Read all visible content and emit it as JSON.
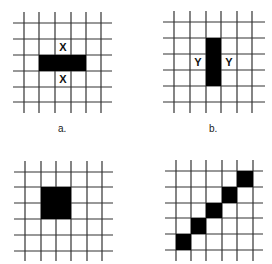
{
  "figure": {
    "colors": {
      "grid_line": "#333333",
      "fill": "#000000",
      "background": "#ffffff"
    },
    "panels": [
      {
        "id": "a",
        "caption": "a.",
        "grid": {
          "x": [
            24,
            39,
            55,
            71,
            86,
            101
          ],
          "y": [
            23,
            39,
            55,
            71,
            87,
            102
          ],
          "extent": [
            13,
            12,
            112,
            113
          ]
        },
        "filled_cells": [
          {
            "x": 39,
            "y": 55,
            "w": 47,
            "h": 16
          }
        ],
        "markers": [
          {
            "text": "X",
            "x": 55,
            "y": 39
          },
          {
            "text": "X",
            "x": 55,
            "y": 71
          }
        ]
      },
      {
        "id": "b",
        "caption": "b.",
        "grid": {
          "x": [
            174,
            190,
            206,
            221,
            237,
            252
          ],
          "y": [
            22,
            38,
            54,
            70,
            86,
            102
          ],
          "extent": [
            163,
            11,
            265,
            113
          ]
        },
        "filled_cells": [
          {
            "x": 206,
            "y": 38,
            "w": 15,
            "h": 48
          }
        ],
        "markers": [
          {
            "text": "Y",
            "x": 190,
            "y": 54
          },
          {
            "text": "Y",
            "x": 221,
            "y": 54
          }
        ]
      },
      {
        "id": "c",
        "caption": "",
        "grid": {
          "x": [
            25,
            41,
            56,
            71,
            87,
            102
          ],
          "y": [
            172,
            187,
            203,
            219,
            235,
            251
          ],
          "extent": [
            14,
            161,
            113,
            261
          ]
        },
        "filled_cells": [
          {
            "x": 41,
            "y": 187,
            "w": 30,
            "h": 32
          }
        ],
        "markers": []
      },
      {
        "id": "d",
        "caption": "",
        "grid": {
          "x": [
            176,
            191,
            206,
            222,
            237,
            253
          ],
          "y": [
            171,
            187,
            203,
            218,
            234,
            250
          ],
          "extent": [
            165,
            160,
            263,
            261
          ]
        },
        "filled_cells": [
          {
            "x": 237,
            "y": 171,
            "w": 16,
            "h": 16
          },
          {
            "x": 222,
            "y": 187,
            "w": 15,
            "h": 16
          },
          {
            "x": 206,
            "y": 203,
            "w": 16,
            "h": 15
          },
          {
            "x": 191,
            "y": 218,
            "w": 15,
            "h": 16
          },
          {
            "x": 176,
            "y": 234,
            "w": 15,
            "h": 16
          }
        ],
        "markers": []
      }
    ],
    "captions": {
      "a": {
        "text": "a.",
        "x": 58,
        "y": 124
      },
      "b": {
        "text": "b.",
        "x": 209,
        "y": 124
      }
    }
  }
}
